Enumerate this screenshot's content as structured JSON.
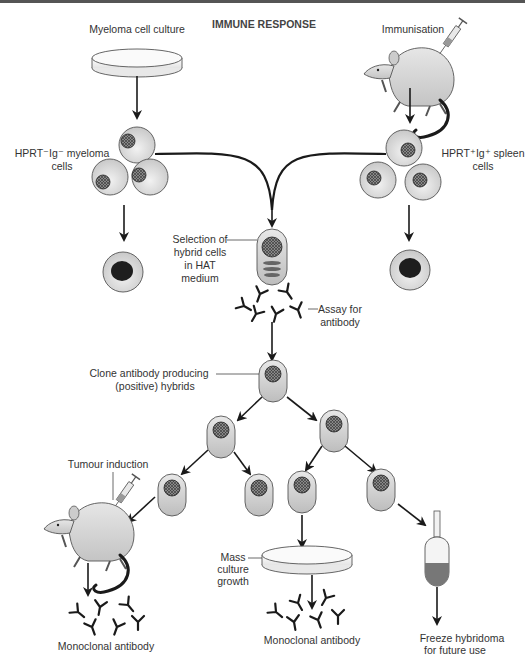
{
  "diagram": {
    "title": "IMMUNE RESPONSE",
    "type": "flowchart",
    "labels": {
      "myeloma_culture": "Myeloma cell culture",
      "immunisation": "Immunisation",
      "myeloma_cells_line1": "HPRT⁻Ig⁻ myeloma",
      "myeloma_cells_line2": "cells",
      "spleen_cells_line1": "HPRT⁺Ig⁺ spleen",
      "spleen_cells_line2": "cells",
      "selection_line1": "Selection of",
      "selection_line2": "hybrid cells",
      "selection_line3": "in HAT",
      "selection_line4": "medium",
      "assay_line1": "Assay for",
      "assay_line2": "antibody",
      "clone_line1": "Clone antibody producing",
      "clone_line2": "(positive) hybrids",
      "tumour_induction": "Tumour induction",
      "mass_line1": "Mass",
      "mass_line2": "culture",
      "mass_line3": "growth",
      "mono_left": "Monoclonal antibody",
      "mono_center": "Monoclonal antibody",
      "freeze_line1": "Freeze hybridoma",
      "freeze_line2": "for future use"
    },
    "nodes": [
      {
        "id": "myeloma-culture",
        "kind": "petri-dish"
      },
      {
        "id": "mouse-immunised",
        "kind": "mouse-with-syringe"
      },
      {
        "id": "myeloma-cells",
        "kind": "cell-cluster"
      },
      {
        "id": "spleen-cells",
        "kind": "cell-cluster"
      },
      {
        "id": "myeloma-dead",
        "kind": "dead-cell"
      },
      {
        "id": "spleen-dead",
        "kind": "dead-cell"
      },
      {
        "id": "hybrid-cell",
        "kind": "hybrid-cell"
      },
      {
        "id": "antibody-assay",
        "kind": "antibodies"
      },
      {
        "id": "clone-cell",
        "kind": "hybridoma"
      },
      {
        "id": "mouse-tumour",
        "kind": "mouse-with-syringe"
      },
      {
        "id": "mass-culture",
        "kind": "petri-dish"
      },
      {
        "id": "freeze-vial",
        "kind": "vial"
      }
    ],
    "colors": {
      "line": "#1a1a1a",
      "cell_fill": "#dcdcdc",
      "nucleus_dark": "#1e1e1e",
      "text": "#333333"
    }
  }
}
